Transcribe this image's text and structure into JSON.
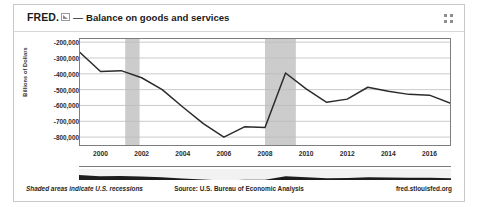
{
  "header": {
    "wordmark": "FRED.",
    "logo_icon": "fred-graph-icon",
    "dash": "—",
    "series_title": "Balance on goods and services",
    "expand_icon": "fullscreen-expand-icon"
  },
  "footer": {
    "note": "Shaded areas indicate U.S. recessions",
    "source": "Source: U.S. Bureau of Economic Analysis",
    "url": "fred.stlouisfed.org"
  },
  "colors": {
    "line": "#2b2b2b",
    "recession_band": "#cccccc",
    "gridline": "#bcbcbc",
    "frame": "#7d7d7d",
    "background": "#ffffff",
    "navigator": "#1c1c1c"
  },
  "chart_data": {
    "type": "line",
    "title": "Balance on goods and services",
    "xlabel": "",
    "ylabel": "Billions of Dollars",
    "xlim": [
      1999.0,
      2017.0
    ],
    "ylim": [
      -850000,
      -180000
    ],
    "grid": true,
    "legend": "none",
    "ytick_labels": [
      "-200,000",
      "-300,000",
      "-400,000",
      "-500,000",
      "-600,000",
      "-700,000",
      "-800,000"
    ],
    "ytick_values": [
      -200000,
      -300000,
      -400000,
      -500000,
      -600000,
      -700000,
      -800000
    ],
    "xtick_labels": [
      "2000",
      "2002",
      "2004",
      "2006",
      "2008",
      "2010",
      "2012",
      "2014",
      "2016"
    ],
    "xtick_values": [
      2000,
      2002,
      2004,
      2006,
      2008,
      2010,
      2012,
      2014,
      2016
    ],
    "series": [
      {
        "name": "Balance on goods and services",
        "x": [
          1999.0,
          2000.0,
          2001.0,
          2002.0,
          2003.0,
          2004.0,
          2005.0,
          2006.0,
          2007.0,
          2008.0,
          2009.0,
          2010.0,
          2011.0,
          2012.0,
          2013.0,
          2014.0,
          2015.0,
          2016.0,
          2017.0
        ],
        "values": [
          -265000,
          -385000,
          -380000,
          -425000,
          -500000,
          -610000,
          -715000,
          -800000,
          -735000,
          -740000,
          -395000,
          -495000,
          -580000,
          -560000,
          -485000,
          -510000,
          -530000,
          -535000,
          -585000
        ]
      }
    ],
    "annotations": [
      {
        "type": "recession_band",
        "label": "2001 recession",
        "start": 2001.2,
        "end": 2001.9
      },
      {
        "type": "recession_band",
        "label": "2007-2009 recession",
        "start": 2008.0,
        "end": 2009.5
      }
    ]
  }
}
